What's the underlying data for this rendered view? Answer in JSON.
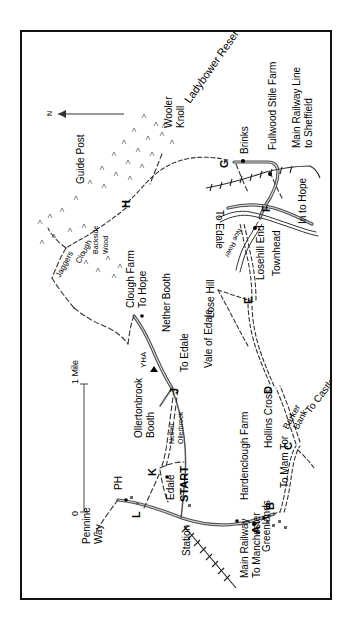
{
  "map": {
    "title": "Edale and Hope Valley walking route map",
    "orientation_note": "map rotated 90 degrees counter-clockwise",
    "north_arrow_label": "N",
    "scale": {
      "start_label": "0",
      "end_label": "1 Mile"
    },
    "waypoints": [
      {
        "id": "A",
        "x": 232,
        "y": 492
      },
      {
        "id": "B",
        "x": 258,
        "y": 480
      },
      {
        "id": "C",
        "x": 275,
        "y": 414
      },
      {
        "id": "D",
        "x": 254,
        "y": 357
      },
      {
        "id": "E",
        "x": 236,
        "y": 268
      },
      {
        "id": "F",
        "x": 251,
        "y": 173
      },
      {
        "id": "G",
        "x": 210,
        "y": 130
      },
      {
        "id": "H",
        "x": 112,
        "y": 172
      },
      {
        "id": "J",
        "x": 152,
        "y": 355
      },
      {
        "id": "K",
        "x": 138,
        "y": 437
      },
      {
        "id": "L",
        "x": 122,
        "y": 478
      }
    ],
    "labels": [
      {
        "name": "ladybower-reservoir",
        "text": "Ladybower Reservoir"
      },
      {
        "name": "wooler-knoll",
        "text": "Wooler Knoll"
      },
      {
        "name": "guide-post",
        "text": "Guide Post"
      },
      {
        "name": "jaggers-clough",
        "text": "Jaggers Clough"
      },
      {
        "name": "backside-wood",
        "text": "Backside Wood"
      },
      {
        "name": "clough-farm",
        "text": "Clough Farm"
      },
      {
        "name": "to-hope",
        "text": "To Hope"
      },
      {
        "name": "nether-booth",
        "text": "Nether Booth"
      },
      {
        "name": "yha",
        "text": "YHA"
      },
      {
        "name": "to-edale-lower",
        "text": "To Edale"
      },
      {
        "name": "vale-of-edale",
        "text": "Vale of Edale"
      },
      {
        "name": "ollertonbrook-booth",
        "text": "Ollertonbrook Booth"
      },
      {
        "name": "nether-ollerbrook",
        "text": "Nether Ollerbrook"
      },
      {
        "name": "ph",
        "text": "PH"
      },
      {
        "name": "pennine-way",
        "text": "Pennine Way"
      },
      {
        "name": "edale",
        "text": "Edale"
      },
      {
        "name": "station",
        "text": "Station"
      },
      {
        "name": "start",
        "text": "START"
      },
      {
        "name": "main-railway-to-manchester",
        "text": "Main Railway To Manchester"
      },
      {
        "name": "greenlands",
        "text": "Greenlands"
      },
      {
        "name": "hardenclough-farm",
        "text": "Hardenclough Farm"
      },
      {
        "name": "to-mam-tor",
        "text": "To Mam Tor"
      },
      {
        "name": "hollins-cross",
        "text": "Hollins Cross"
      },
      {
        "name": "barker-bank",
        "text": "Barker Bank"
      },
      {
        "name": "to-castleton",
        "text": "To Castleton"
      },
      {
        "name": "lose-hill",
        "text": "Lose Hill"
      },
      {
        "name": "losehill-end",
        "text": "Losehill End"
      },
      {
        "name": "townhead",
        "text": "Townhead"
      },
      {
        "name": "noe-river",
        "text": "Noe River"
      },
      {
        "name": "to-edale-upper",
        "text": "To Edale"
      },
      {
        "name": "in-to-hope",
        "text": "In to Hope"
      },
      {
        "name": "brinks",
        "text": "Brinks"
      },
      {
        "name": "fullwood-stile-farm",
        "text": "Fullwood Stile Farm"
      },
      {
        "name": "main-railway-line-to-sheffield",
        "text": "Main Railway Line to Sheffield"
      }
    ],
    "text": {
      "ladybower_reservoir": "Ladybower Reservoir",
      "wooler_knoll_1": "Wooler",
      "wooler_knoll_2": "Knoll",
      "guide_post": "Guide Post",
      "jaggers": "Jaggers",
      "clough": "Clough",
      "backside": "Backside",
      "wood": "Wood",
      "clough_farm": "Clough Farm",
      "to_hope": "To Hope",
      "nether_booth": "Nether Booth",
      "yha": "YHA",
      "to_edale_lower": "To Edale",
      "vale_of_edale": "Vale of Edale",
      "ollertonbrook": "Ollertonbrook",
      "booth": "Booth",
      "nether": "Nether",
      "ollerbrook": "Ollerbrook",
      "ph": "PH",
      "pennine": "Pennine",
      "way": "Way",
      "edale": "Edale",
      "station": "Station",
      "start": "START",
      "main_railway": "Main Railway",
      "to_manchester": "To Manchester",
      "greenlands": "Greenlands",
      "hardenclough_farm": "Hardenclough Farm",
      "to_mam_tor": "To Mam Tor",
      "hollins_cross": "Hollins Cross",
      "barker": "Barker",
      "bank": "Bank",
      "to_castleton": "To Castleton",
      "lose_hill": "Lose Hill",
      "losehill_end": "Losehill End",
      "townhead": "Townhead",
      "noe_river": "Noe River",
      "to_edale_upper": "To Edale",
      "in_to_hope": "In to Hope",
      "brinks": "Brinks",
      "fullwood_stile_farm": "Fullwood Stile Farm",
      "main_railway_line": "Main Railway Line",
      "to_sheffield": "to Sheffield",
      "scale_zero": "0",
      "scale_one_mile": "1 Mile",
      "north": "N",
      "wp_a": "A",
      "wp_b": "B",
      "wp_c": "C",
      "wp_d": "D",
      "wp_e": "E",
      "wp_f": "F",
      "wp_g": "G",
      "wp_h": "H",
      "wp_j": "J",
      "wp_k": "K",
      "wp_l": "L"
    },
    "colors": {
      "border": "#111111",
      "road": "#4a4a4a",
      "path": "#333333",
      "background": "#ffffff"
    }
  }
}
